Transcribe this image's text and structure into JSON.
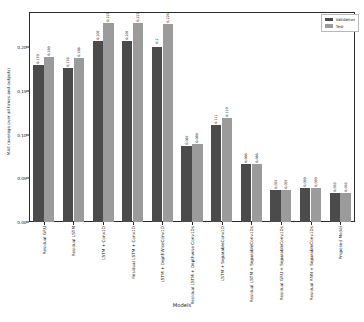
{
  "chart_data": {
    "type": "bar",
    "title": "",
    "xlabel": "Models",
    "ylabel": "MAE (average over all times and outputs)",
    "ylim": [
      0.0,
      0.24
    ],
    "yticks": [
      0.0,
      0.05,
      0.1,
      0.15,
      0.2
    ],
    "ytick_labels": [
      "0.00",
      "0.05",
      "0.10",
      "0.15",
      "0.20"
    ],
    "grid": false,
    "legend_position": "upper right",
    "categories": [
      "Residual GRU",
      "Residual LSTM",
      "LSTM + Conv1D",
      "Residual LSTM + Conv1D",
      "LSTM + DepthWiseConv1D",
      "Residual LSTM + Depthwise Conv1Ds",
      "LSTM + SeparableConv1D",
      "Residual LSTM + SeparableConv1Ds",
      "Residual GRU + SeparableConv1Ds",
      "Residual RNN + SeparableConv1Ds",
      "Proposed Model"
    ],
    "series": [
      {
        "name": "Validation",
        "color": "#4b4b4b",
        "values": [
          0.179,
          0.176,
          0.207,
          0.207,
          0.2,
          0.087,
          0.111,
          0.066,
          0.037,
          0.039,
          0.033
        ],
        "labels": [
          "0.179",
          "0.176",
          "0.207",
          "0.207",
          "0.2",
          "0.087",
          "0.111",
          "0.066",
          "0.037",
          "0.039",
          "0.033"
        ]
      },
      {
        "name": "Test",
        "color": "#9b9b9b",
        "values": [
          0.189,
          0.188,
          0.227,
          0.227,
          0.226,
          0.089,
          0.119,
          0.066,
          0.037,
          0.039,
          0.033
        ],
        "labels": [
          "0.189",
          "0.188",
          "0.227",
          "0.227",
          "0.226",
          "0.089",
          "0.119",
          "0.066",
          "0.037",
          "0.039",
          "0.033"
        ]
      }
    ]
  },
  "legend": {
    "items": [
      {
        "label": "Validation",
        "color": "#4b4b4b"
      },
      {
        "label": "Test",
        "color": "#9b9b9b"
      }
    ]
  },
  "colors": {
    "validation": "#4b4b4b",
    "test": "#9b9b9b",
    "axis": "#2b2b2b",
    "background": "#ffffff"
  }
}
